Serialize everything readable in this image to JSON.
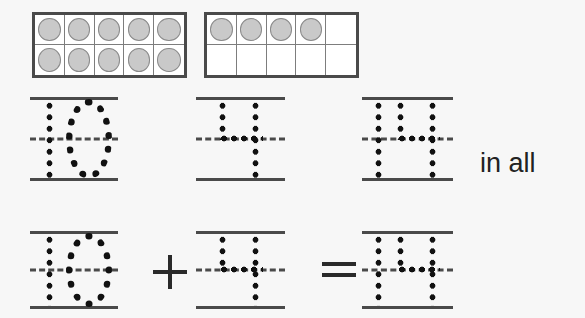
{
  "worksheet": {
    "type": "ten-frame-addition-tracing",
    "in_all_label": "in all",
    "plus_symbol": "+",
    "equals_symbol": "="
  },
  "tenframes": [
    {
      "name": "tenframe-ten",
      "columns": 5,
      "rows": 2,
      "filled_count": 10,
      "value": 10,
      "cells": [
        [
          true,
          true,
          true,
          true,
          true
        ],
        [
          true,
          true,
          true,
          true,
          true
        ]
      ]
    },
    {
      "name": "tenframe-four",
      "columns": 5,
      "rows": 2,
      "filled_count": 4,
      "value": 4,
      "cells": [
        [
          true,
          true,
          true,
          true,
          false
        ],
        [
          false,
          false,
          false,
          false,
          false
        ]
      ]
    }
  ],
  "trace_rows": [
    {
      "name": "answer-row",
      "slots": [
        {
          "name": "trace-ten-top",
          "value": "10",
          "digits": [
            "1",
            "0"
          ]
        },
        {
          "name": "trace-four-top",
          "value": "4",
          "digits": [
            "4"
          ]
        },
        {
          "name": "trace-fourteen-top",
          "value": "14",
          "digits": [
            "1",
            "4"
          ]
        }
      ],
      "trailing_text": "in all"
    },
    {
      "name": "equation-row",
      "slots": [
        {
          "name": "trace-ten-bottom",
          "value": "10",
          "digits": [
            "1",
            "0"
          ]
        },
        {
          "name": "trace-four-bottom",
          "value": "4",
          "digits": [
            "4"
          ]
        },
        {
          "name": "trace-fourteen-bottom",
          "value": "14",
          "digits": [
            "1",
            "4"
          ]
        }
      ],
      "operators": [
        "+",
        "="
      ]
    }
  ],
  "equation": {
    "addend_one": "10",
    "addend_two": "4",
    "sum": "14",
    "expression": "10 + 4 = 14"
  },
  "colors": {
    "background": "#f7f7f7",
    "frame_border": "#4a4a4a",
    "cell_divider": "#7d7d7d",
    "counter_fill": "#c9c9c9",
    "counter_stroke": "#8a8a8a",
    "rule_line": "#4a4a4a",
    "dot_color": "#111111",
    "text_color": "#222222"
  }
}
